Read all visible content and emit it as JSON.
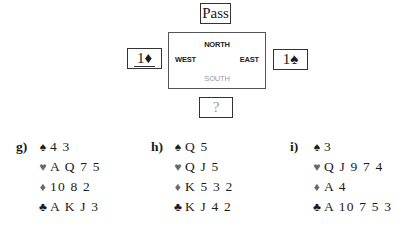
{
  "auction": {
    "north": {
      "bid": "Pass"
    },
    "west": {
      "bid": "1♦",
      "underlined": true
    },
    "east": {
      "bid": "1♠"
    },
    "south": {
      "bid": "?"
    },
    "table_labels": {
      "north": "NORTH",
      "west": "WEST",
      "east": "EAST",
      "south": "SOUTH"
    }
  },
  "hands": [
    {
      "label": "g)",
      "spades": "4 3",
      "hearts": "A Q 7 5",
      "diamonds": "10 8 2",
      "clubs": "A K J 3"
    },
    {
      "label": "h)",
      "spades": "Q 5",
      "hearts": "Q J 5",
      "diamonds": "K 5 3 2",
      "clubs": "K J 4 2"
    },
    {
      "label": "i)",
      "spades": "3",
      "hearts": "Q J 9 7 4",
      "diamonds": "A 4",
      "clubs": "A 10 7 5 3"
    }
  ],
  "suit_symbols": {
    "spades": "♠",
    "hearts": "♥",
    "diamonds": "♦",
    "clubs": "♣"
  }
}
